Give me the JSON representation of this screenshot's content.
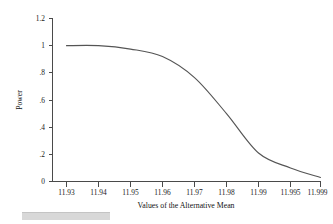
{
  "chart_data": {
    "type": "line",
    "title": "",
    "xlabel": "Values of the Alternative Mean",
    "ylabel": "Power",
    "categories": [
      "11.93",
      "11.94",
      "11.95",
      "11.96",
      "11.97",
      "11.98",
      "11.99",
      "11.995",
      "11.999"
    ],
    "values": [
      1.0,
      1.0,
      0.975,
      0.92,
      0.765,
      0.5,
      0.21,
      0.1,
      0.03
    ],
    "ylim": [
      0,
      1.2
    ],
    "yticks": [
      "0",
      ".2",
      ".4",
      ".6",
      ".8",
      "1",
      "1.2"
    ],
    "ytick_values": [
      0,
      0.2,
      0.4,
      0.6,
      0.8,
      1.0,
      1.2
    ],
    "grid": false,
    "legend": false,
    "legend_position": "none",
    "series": [
      {
        "name": "Power",
        "color": "#555555",
        "values": [
          1.0,
          1.0,
          0.975,
          0.92,
          0.765,
          0.5,
          0.21,
          0.1,
          0.03
        ]
      }
    ],
    "axis_color": "#4a4a4a"
  }
}
